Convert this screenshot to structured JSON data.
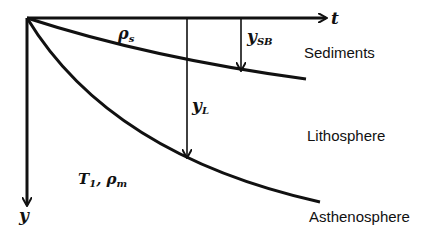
{
  "diagram": {
    "axes": {
      "horizontal_label": "t",
      "vertical_label": "y"
    },
    "symbols": {
      "sediment_density": {
        "base": "ρ",
        "sub": "s"
      },
      "sediment_thickness": {
        "base": "y",
        "sub": "SB"
      },
      "lithosphere_thickness": {
        "base": "y",
        "sub": "L"
      },
      "mantle_props": {
        "base1": "T",
        "sub1": "1",
        "sep": ", ",
        "base2": "ρ",
        "sub2": "m"
      }
    },
    "regions": {
      "sediments": "Sediments",
      "lithosphere": "Lithosphere",
      "asthenosphere": "Asthenosphere"
    },
    "colors": {
      "line": "#111111",
      "background": "#ffffff"
    }
  }
}
